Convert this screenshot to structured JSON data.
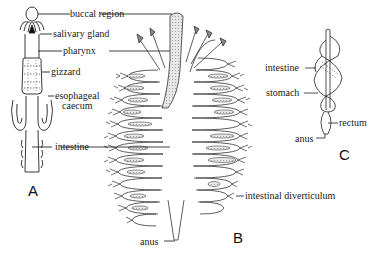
{
  "figure": {
    "panels": [
      {
        "id": "A",
        "label": "A",
        "parts": [
          "buccal region",
          "salivary gland",
          "pharynx",
          "gizzard",
          "esophageal caecum",
          "intestine"
        ]
      },
      {
        "id": "B",
        "label": "B",
        "parts": [
          "intestinal diverticulum",
          "anus"
        ]
      },
      {
        "id": "C",
        "label": "C",
        "parts": [
          "intestine",
          "stomach",
          "rectum",
          "anus"
        ]
      }
    ],
    "labels": {
      "buccal_region": "buccal region",
      "salivary_gland": "salivary gland",
      "pharynx": "pharynx",
      "gizzard": "gizzard",
      "esophageal_caecum_line1": "esophageal",
      "esophageal_caecum_line2": "caecum",
      "intestine_a": "intestine",
      "intestinal_diverticulum": "intestinal diverticulum",
      "anus_b": "anus",
      "intestine_c": "intestine",
      "stomach": "stomach",
      "rectum": "rectum",
      "anus_c": "anus"
    },
    "panel_letters": {
      "a": "A",
      "b": "B",
      "c": "C"
    }
  }
}
